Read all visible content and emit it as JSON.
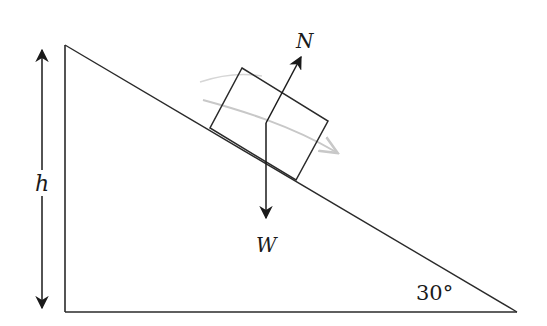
{
  "diagram": {
    "type": "inclined-plane-free-body",
    "labels": {
      "normal_force": "N",
      "weight": "W",
      "height": "h",
      "angle": "30°"
    },
    "colors": {
      "line": "#2a2a2a",
      "faint_arrow": "#c8c8c8",
      "background": "#ffffff"
    },
    "incline_angle_deg": 30
  }
}
